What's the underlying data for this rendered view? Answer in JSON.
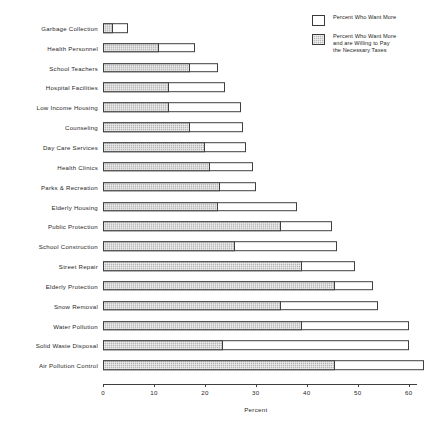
{
  "chart_data": {
    "type": "bar",
    "orientation": "horizontal",
    "stacked": false,
    "overlay": true,
    "title": "",
    "xlabel": "Percent",
    "ylabel": "",
    "xlim": [
      0,
      63
    ],
    "xticks": [
      0,
      10,
      20,
      30,
      40,
      50,
      60
    ],
    "xtick_labels": [
      "0",
      "10",
      "20",
      "30",
      "40",
      "50",
      "60"
    ],
    "grid": false,
    "legend_position": "top-right",
    "legend": [
      {
        "label": "Percent Who Want More",
        "swatch": "white",
        "color": "#ffffff"
      },
      {
        "label_lines": [
          "Percent Who Want More",
          "and are Willing to Pay",
          "the Necessary Taxes"
        ],
        "label": "Percent Who Want More and are Willing to Pay the Necessary Taxes",
        "swatch": "gray-hatched",
        "color": "#b5b5b5"
      }
    ],
    "categories": [
      "Garbage Collection",
      "Health Personnel",
      "School Teachers",
      "Hospital Facilities",
      "Low Income Housing",
      "Counseling",
      "Day Care Services",
      "Health Clinics",
      "Parks & Recreation",
      "Elderly Housing",
      "Public Protection",
      "School Construction",
      "Street Repair",
      "Elderly Protection",
      "Snow Removal",
      "Water Pollution",
      "Solid Waste Disposal",
      "Air Pollution Control"
    ],
    "series": [
      {
        "name": "Percent Who Want More",
        "values": [
          5,
          18,
          22.5,
          24,
          27,
          27.5,
          28,
          29.5,
          30,
          38,
          45,
          46,
          49.5,
          53,
          54,
          60,
          60,
          63
        ]
      },
      {
        "name": "Percent Who Want More and are Willing to Pay the Necessary Taxes",
        "values": [
          2,
          11,
          17,
          13,
          13,
          17,
          20,
          21,
          23,
          22.5,
          35,
          26,
          39,
          45.5,
          35,
          39,
          23.5,
          45.5
        ]
      }
    ]
  }
}
